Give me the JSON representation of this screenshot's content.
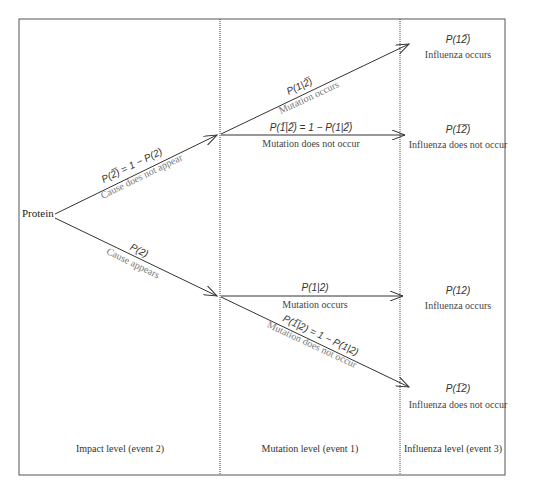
{
  "diagram": {
    "root": "Protein",
    "levels": [
      "Impact level (event 2)",
      "Mutation level (event 1)",
      "Influenza level (event 3)"
    ],
    "level1_branches": [
      {
        "prob": "P(2̅) = 1 − P(2)",
        "label": "Cause does not appear"
      },
      {
        "prob": "P(2)",
        "label": "Cause appears"
      }
    ],
    "level2_branches": [
      {
        "prob": "P(1|2̅)",
        "label": "Mutation occurs"
      },
      {
        "prob": "P(1̅|2̅) = 1 − P(1|2̅)",
        "label": "Mutation does not occur"
      },
      {
        "prob": "P(1|2)",
        "label": "Mutation occurs"
      },
      {
        "prob": "P(1̅|2) = 1 − P(1|2)",
        "label": "Mutation does not occur"
      }
    ],
    "outcomes": [
      {
        "prob": "P(12̅)",
        "label": "Influenza occurs"
      },
      {
        "prob": "P(1̅2̅)",
        "label": "Influenza does not occur"
      },
      {
        "prob": "P(12)",
        "label": "Influenza occurs"
      },
      {
        "prob": "P(1̅2)",
        "label": "Influenza does not occur"
      }
    ]
  }
}
